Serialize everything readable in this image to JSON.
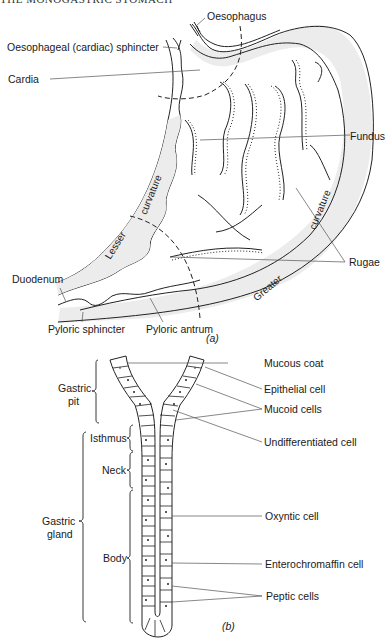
{
  "page_header": "THE MONOGASTRIC STOMACH",
  "figure_a": {
    "caption": "(a)",
    "labels": {
      "oesophagus": "Oesophagus",
      "cardiac_sphincter": "Oesophageal (cardiac) sphincter",
      "cardia": "Cardia",
      "fundus": "Fundus",
      "rugae": "Rugae",
      "duodenum": "Duodenum",
      "pyloric_sphincter": "Pyloric sphincter",
      "pyloric_antrum": "Pyloric antrum",
      "lesser": "Lesser",
      "lesser_curvature": "curvature",
      "greater": "Greater",
      "greater_curvature": "curvature"
    }
  },
  "figure_b": {
    "caption": "(b)",
    "left_labels": {
      "gastric_pit": "Gastric pit",
      "gastric_pit_l1": "Gastric",
      "gastric_pit_l2": "pit",
      "isthmus": "Isthmus",
      "neck": "Neck",
      "body": "Body",
      "gastric_gland_l1": "Gastric",
      "gastric_gland_l2": "gland"
    },
    "right_labels": {
      "mucous_coat": "Mucous coat",
      "epithelial_cell": "Epithelial cell",
      "mucoid_cells": "Mucoid cells",
      "undifferentiated_cell": "Undifferentiated cell",
      "oxyntic_cell": "Oxyntic cell",
      "enterochromaffin_cell": "Enterochromaffin cell",
      "peptic_cells": "Peptic cells"
    }
  }
}
